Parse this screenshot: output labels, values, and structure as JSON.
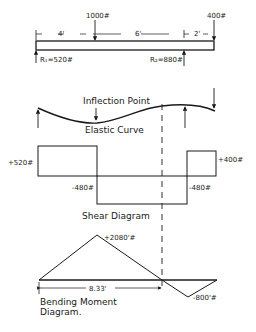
{
  "beam": {
    "loads": [
      {
        "label": "1000#",
        "position_ft": 4
      },
      {
        "label": "400#",
        "position_ft": 12
      }
    ],
    "dimensions": [
      "4'",
      "6'",
      "2'"
    ],
    "reactions": [
      {
        "label": "R₁=520#",
        "position_ft": 0
      },
      {
        "label": "R₂=880#",
        "position_ft": 10
      }
    ]
  },
  "elastic_curve": {
    "title": "Elastic Curve",
    "inflection_label": "Inflection Point"
  },
  "shear": {
    "title": "Shear Diagram",
    "labels": {
      "left_pos": "+520#",
      "left_neg": "-480#",
      "right_neg": "-480#",
      "right_pos": "+400#"
    }
  },
  "moment": {
    "title_line1": "Bending Moment",
    "title_line2": "Diagram.",
    "max_label": "+2080'#",
    "min_label": "-800'#",
    "zero_distance": "8.33'"
  },
  "colors": {
    "ink": "#1a1a1a",
    "background": "#ffffff"
  }
}
